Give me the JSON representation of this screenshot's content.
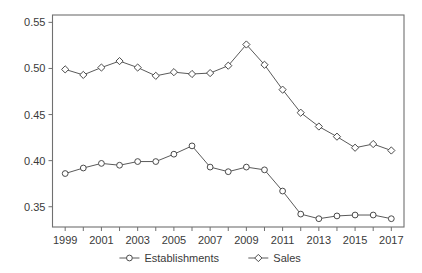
{
  "chart_data": {
    "type": "line",
    "title": "",
    "subtitle": "",
    "xlabel": "",
    "ylabel": "",
    "x": [
      1999,
      2000,
      2001,
      2002,
      2003,
      2004,
      2005,
      2006,
      2007,
      2008,
      2009,
      2010,
      2011,
      2012,
      2013,
      2014,
      2015,
      2016,
      2017
    ],
    "xtick_labels": [
      "1999",
      "2001",
      "2003",
      "2005",
      "2007",
      "2009",
      "2011",
      "2013",
      "2015",
      "2017"
    ],
    "xtick_values": [
      1999,
      2001,
      2003,
      2005,
      2007,
      2009,
      2011,
      2013,
      2015,
      2017
    ],
    "ytick_labels": [
      "0.35",
      "0.40",
      "0.45",
      "0.50",
      "0.55"
    ],
    "ytick_values": [
      0.35,
      0.4,
      0.45,
      0.5,
      0.55
    ],
    "xlim": [
      1998.3,
      2017.7
    ],
    "ylim": [
      0.328,
      0.558
    ],
    "grid": false,
    "legend_position": "bottom-center",
    "series": [
      {
        "name": "Establishments",
        "marker": "circle",
        "color": "#4a4a4a",
        "values": [
          0.386,
          0.392,
          0.397,
          0.395,
          0.399,
          0.399,
          0.407,
          0.416,
          0.393,
          0.388,
          0.393,
          0.39,
          0.367,
          0.342,
          0.337,
          0.34,
          0.341,
          0.341,
          0.337
        ]
      },
      {
        "name": "Sales",
        "marker": "diamond",
        "color": "#4a4a4a",
        "values": [
          0.499,
          0.493,
          0.501,
          0.508,
          0.501,
          0.492,
          0.496,
          0.494,
          0.495,
          0.503,
          0.526,
          0.504,
          0.477,
          0.452,
          0.437,
          0.426,
          0.414,
          0.418,
          0.411
        ]
      }
    ]
  },
  "legend": {
    "items": [
      {
        "label": "Establishments",
        "marker": "circle"
      },
      {
        "label": "Sales",
        "marker": "diamond"
      }
    ]
  },
  "colors": {
    "axis": "#707070",
    "line": "#5a5a5a",
    "marker_stroke": "#4a4a4a",
    "marker_fill": "#ffffff",
    "text": "#3a3a3a",
    "background": "#ffffff"
  }
}
